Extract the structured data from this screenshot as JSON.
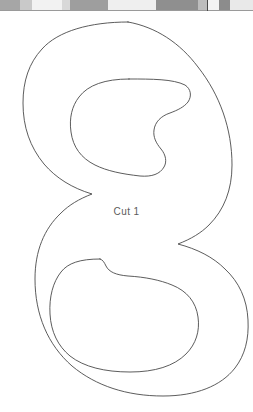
{
  "page": {
    "background_color": "#ffffff",
    "width": 253,
    "height": 412,
    "document_type": "cut-pattern-template"
  },
  "top_strip": {
    "name": "scanned-edge-strip",
    "height": 11,
    "rule_color": "#9a9a9a",
    "divider_color": "#4a4a4a",
    "divider_x": 207,
    "segments": [
      {
        "width": 20,
        "color": "#a6a6a6"
      },
      {
        "width": 12,
        "color": "#c9c9c9"
      },
      {
        "width": 30,
        "color": "#f2f2f2"
      },
      {
        "width": 8,
        "color": "#d8d8d8"
      },
      {
        "width": 38,
        "color": "#9e9e9e"
      },
      {
        "width": 48,
        "color": "#efefef"
      },
      {
        "width": 42,
        "color": "#8f8f8f"
      },
      {
        "width": 9,
        "color": "#bdbdbd"
      },
      {
        "width": 12,
        "color": "#f4f4f4"
      },
      {
        "width": 11,
        "color": "#8c8c8c"
      },
      {
        "width": 23,
        "color": "#e9e9e9"
      }
    ]
  },
  "pattern": {
    "glyph": "S",
    "label": "Cut 1",
    "stroke_color": "#4a4a4a",
    "stroke_width": 0.9,
    "fill": "none",
    "label_color": "#5b5b5b",
    "outline_path": "M 143.5 11.5 C 104 11.5 72 22.5 52 41.5 C 32 60.5 22.5 85 23.5 112 C 24.5 141 38.5 163.5 62 179.5 C 82 193 108 201.5 136 209.5 C 162 217 182 225 192 238 C 200 248.5 200.5 262 194.5 273.5 C 187 288 171 297 152 299 C 136.5 300.5 122 297.5 111.5 290.5 C 101.5 284 95.5 274 94.5 262.5 L 94.2 258 L 58.5 258 C 47.5 258 41.5 261.5 38 267 C 34.5 272.5 33.5 280 34 289.5 C 35.5 317 49 338.5 71.5 353.5 C 94.5 369 126 377 161 377 C 200 377 232 366 252.5 346.5 L 253 346 L 253 300 L 250 304.5 C 241 317 227 325.5 210.5 328.5 C 197 331 184 329 174.5 322.5 C 165 316 159.5 305.5 158.5 292.5 L 158.2 288 L 194 288 C 205 288 211 284.5 214.5 279 C 218 273.5 219 266 218.5 256.5 C 217 229 203.5 207.5 181 192.5 C 158 177 126.5 169 91.5 169 C 52.5 169 20.5 180 0 199.5 L 0 11.5 Z",
    "description": "thin outline of capital letter S drawn as a cutting template"
  },
  "cut_label": {
    "text": "Cut 1",
    "color": "#5b5b5b",
    "font_size_px": 10
  }
}
